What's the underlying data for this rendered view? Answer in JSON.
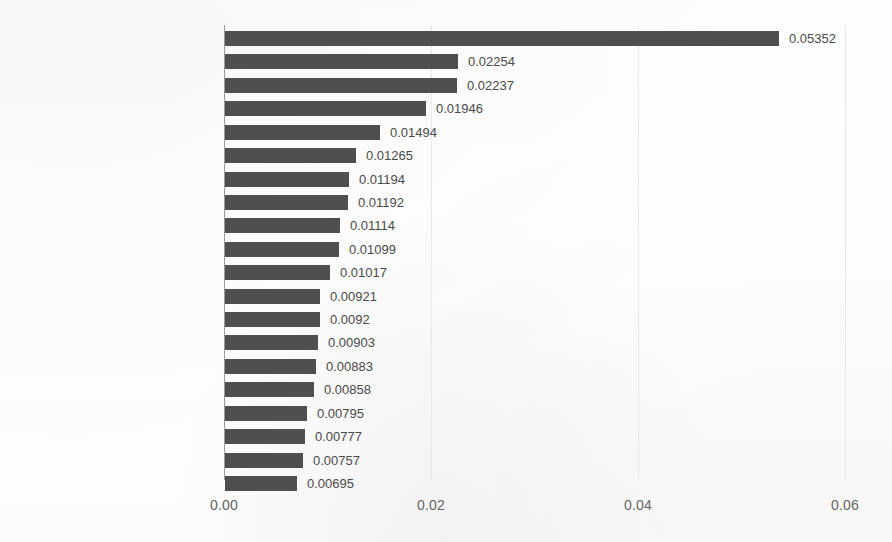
{
  "chart_data": {
    "type": "bar",
    "orientation": "horizontal",
    "title": "",
    "subtitle": "",
    "xlabel": "",
    "ylabel": "",
    "xlim": [
      0.0,
      0.06
    ],
    "xticks": [
      "0.00",
      "0.02",
      "0.04",
      "0.06"
    ],
    "xtick_values": [
      0.0,
      0.02,
      0.04,
      0.06
    ],
    "grid": true,
    "grid_axis": "x",
    "legend": null,
    "bar_color": "#4f4f4f",
    "value_label_color": "#4a4a4a",
    "category_label_color": "#1b1b1b",
    "categories": [
      "negative (sentiment)",
      "percentages (symbols)",
      "nouns-numerals (PoS)",
      "positive (sentiment)",
      "sadness (sentiment)",
      "adverbs-negation (PoS)",
      "words-count (style)",
      "verbs-transitive (PoS)",
      "nouns (Pos)",
      "anger (sentiment)",
      "pronouns-impersonal (PoS)",
      "anxiety (sentiment)",
      "death (topics)",
      "pronouns (PoS)",
      "length (style)",
      "open-question (symbols)",
      "risk (topics)",
      "cognitive (sociolinguistics)",
      "adverbs-interrogative (PoS)",
      "mentions-in-the-middle"
    ],
    "values": [
      0.05352,
      0.02254,
      0.02237,
      0.01946,
      0.01494,
      0.01265,
      0.01194,
      0.01192,
      0.01114,
      0.01099,
      0.01017,
      0.00921,
      0.0092,
      0.00903,
      0.00883,
      0.00858,
      0.00795,
      0.00777,
      0.00757,
      0.00695
    ],
    "value_labels": [
      "0.05352",
      "0.02254",
      "0.02237",
      "0.01946",
      "0.01494",
      "0.01265",
      "0.01194",
      "0.01192",
      "0.01114",
      "0.01099",
      "0.01017",
      "0.00921",
      "0.0092",
      "0.00903",
      "0.00883",
      "0.00858",
      "0.00795",
      "0.00777",
      "0.00757",
      "0.00695"
    ]
  }
}
